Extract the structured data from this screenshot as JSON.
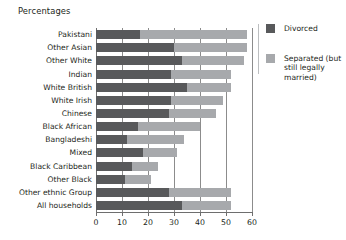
{
  "chart_data": {
    "type": "bar",
    "orientation": "horizontal",
    "stacked": true,
    "title": "Percentages",
    "xlabel": "",
    "ylabel": "",
    "xlim": [
      0,
      60
    ],
    "xticks": [
      0,
      10,
      20,
      30,
      40,
      50,
      60
    ],
    "grid": true,
    "legend_position": "right",
    "categories": [
      "Pakistani",
      "Other Asian",
      "Other White",
      "Indian",
      "White British",
      "White Irish",
      "Chinese",
      "Black African",
      "Bangladeshi",
      "Mixed",
      "Black Caribbean",
      "Other Black",
      "Other ethnic Group",
      "All households"
    ],
    "series": [
      {
        "name": "Divorced",
        "color": "#58595b",
        "values": [
          17,
          30,
          33,
          29,
          35,
          29,
          28,
          16,
          12,
          18,
          14,
          11,
          28,
          33
        ]
      },
      {
        "name": "Separated (but still legally married)",
        "color": "#a7a9ac",
        "values": [
          41,
          28,
          24,
          23,
          17,
          20,
          18,
          24,
          22,
          13,
          10,
          10,
          24,
          19
        ]
      }
    ],
    "totals": [
      58,
      58,
      57,
      52,
      52,
      49,
      46,
      40,
      34,
      31,
      24,
      21,
      52,
      52
    ]
  },
  "legend": {
    "items": [
      {
        "label": "Divorced",
        "color": "#58595b"
      },
      {
        "label": "Separated (but still legally married)",
        "color": "#a7a9ac"
      }
    ]
  }
}
